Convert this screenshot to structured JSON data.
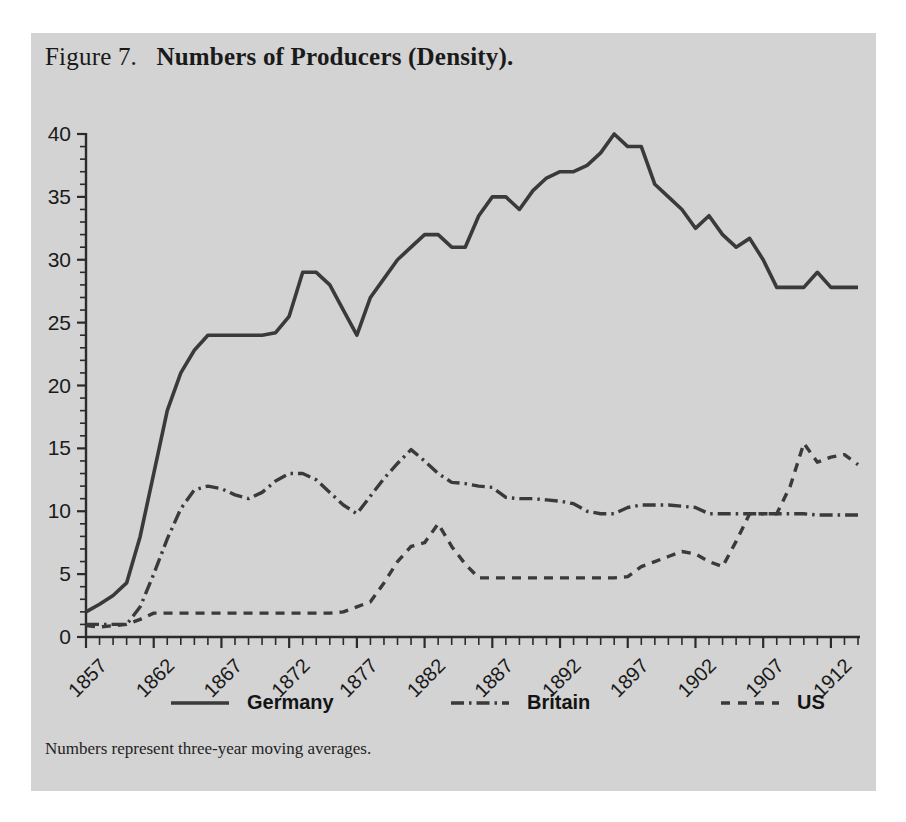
{
  "figure": {
    "label": "Figure 7.",
    "caption": "Numbers of Producers (Density).",
    "note": "Numbers represent three-year moving averages.",
    "panel_color": "#d3d3d3",
    "line_color": "#3a3a3a"
  },
  "legend": {
    "position": "bottom",
    "items": [
      {
        "name": "germany",
        "label": "Germany",
        "style": "solid"
      },
      {
        "name": "britain",
        "label": "Britain",
        "style": "dash-dot"
      },
      {
        "name": "us",
        "label": "US",
        "style": "dashed"
      }
    ]
  },
  "axes": {
    "y_ticks": [
      "0",
      "5",
      "10",
      "15",
      "20",
      "25",
      "30",
      "35",
      "40"
    ],
    "x_ticks": [
      "1857",
      "1862",
      "1867",
      "1872",
      "1877",
      "1882",
      "1887",
      "1892",
      "1897",
      "1902",
      "1907",
      "1912"
    ]
  },
  "chart_data": {
    "type": "line",
    "subtitle": "Numbers represent three-year moving averages.",
    "xlabel": "",
    "ylabel": "",
    "xlim": [
      1857,
      1914
    ],
    "ylim": [
      0,
      40
    ],
    "grid": false,
    "legend_position": "bottom",
    "x": [
      1857,
      1858,
      1859,
      1860,
      1861,
      1862,
      1863,
      1864,
      1865,
      1866,
      1867,
      1868,
      1869,
      1870,
      1871,
      1872,
      1873,
      1874,
      1875,
      1876,
      1877,
      1878,
      1879,
      1880,
      1881,
      1882,
      1883,
      1884,
      1885,
      1886,
      1887,
      1888,
      1889,
      1890,
      1891,
      1892,
      1893,
      1894,
      1895,
      1896,
      1897,
      1898,
      1899,
      1900,
      1901,
      1902,
      1903,
      1904,
      1905,
      1906,
      1907,
      1908,
      1909,
      1910,
      1911,
      1912,
      1913,
      1914
    ],
    "series": [
      {
        "name": "Germany",
        "style": "solid",
        "values": [
          2.0,
          2.6,
          3.3,
          4.3,
          8.0,
          13.0,
          18.0,
          21.0,
          22.8,
          24.0,
          24.0,
          24.0,
          24.0,
          24.0,
          24.2,
          25.5,
          29.0,
          29.0,
          28.0,
          26.0,
          24.0,
          27.0,
          28.5,
          30.0,
          31.0,
          32.0,
          32.0,
          31.0,
          31.0,
          33.5,
          35.0,
          35.0,
          34.0,
          35.5,
          36.5,
          37.0,
          37.0,
          37.5,
          38.5,
          40.0,
          39.0,
          39.0,
          36.0,
          35.0,
          34.0,
          32.5,
          33.5,
          32.0,
          31.0,
          31.7,
          30.0,
          27.8,
          27.8,
          27.8,
          29.0,
          27.8,
          27.8,
          27.8
        ]
      },
      {
        "name": "Britain",
        "style": "dash-dot",
        "values": [
          1.0,
          1.0,
          1.0,
          1.0,
          2.4,
          5.0,
          7.8,
          10.2,
          11.7,
          12.0,
          11.8,
          11.3,
          11.0,
          11.5,
          12.4,
          13.0,
          13.0,
          12.5,
          11.5,
          10.5,
          9.8,
          11.2,
          12.6,
          13.8,
          14.9,
          14.0,
          13.0,
          12.3,
          12.2,
          12.0,
          11.9,
          11.1,
          11.0,
          11.0,
          10.9,
          10.8,
          10.6,
          10.0,
          9.8,
          9.8,
          10.3,
          10.5,
          10.5,
          10.5,
          10.4,
          10.3,
          9.8,
          9.8,
          9.8,
          9.8,
          9.8,
          9.8,
          9.8,
          9.8,
          9.7,
          9.7,
          9.7,
          9.7
        ]
      },
      {
        "name": "US",
        "style": "dashed",
        "values": [
          0.9,
          0.8,
          0.9,
          1.0,
          1.4,
          1.9,
          1.9,
          1.9,
          1.9,
          1.9,
          1.9,
          1.9,
          1.9,
          1.9,
          1.9,
          1.9,
          1.9,
          1.9,
          1.9,
          2.0,
          2.4,
          2.8,
          4.3,
          6.0,
          7.2,
          7.5,
          9.0,
          7.2,
          5.8,
          4.7,
          4.7,
          4.7,
          4.7,
          4.7,
          4.7,
          4.7,
          4.7,
          4.7,
          4.7,
          4.7,
          4.8,
          5.6,
          6.0,
          6.4,
          6.8,
          6.6,
          6.0,
          5.6,
          7.6,
          9.8,
          9.8,
          9.8,
          12.0,
          15.4,
          13.9,
          14.3,
          14.5,
          13.7
        ]
      }
    ]
  }
}
